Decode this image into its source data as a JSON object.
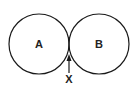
{
  "diagram": {
    "type": "tangent-circles",
    "circles": [
      {
        "label": "A",
        "cx": 39,
        "cy": 44,
        "r": 31
      },
      {
        "label": "B",
        "cx": 100,
        "cy": 44,
        "r": 31
      }
    ],
    "pointer": {
      "label": "X",
      "target": "tangent point between A and B"
    },
    "stroke_color": "#1a1a1a"
  }
}
